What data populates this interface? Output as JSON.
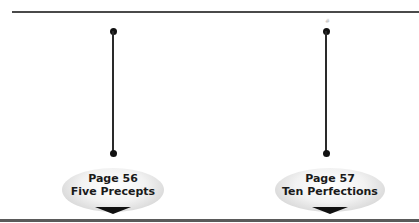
{
  "timeline": {
    "items": [
      {
        "page_label": "Page 56",
        "title": "Five Precepts"
      },
      {
        "page_label": "Page 57",
        "title": "Ten Perfections"
      }
    ],
    "marker_glyph": "#"
  },
  "colors": {
    "rule": "#4a4a4a",
    "connector": "#2a2a2a",
    "pill_light": "#ffffff",
    "pill_dark": "#c4c4c4",
    "text": "#1a1a1a"
  }
}
